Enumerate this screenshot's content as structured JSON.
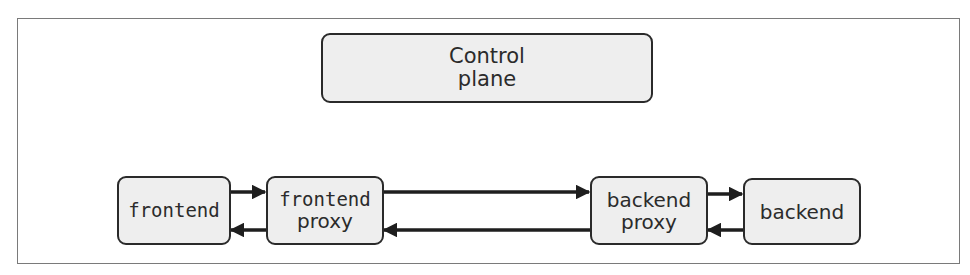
{
  "diagram": {
    "type": "service-mesh",
    "nodes": {
      "control_plane": {
        "line1": "Control",
        "line2": "plane"
      },
      "frontend": {
        "label": "frontend"
      },
      "frontend_proxy": {
        "line1": "frontend",
        "line2": "proxy"
      },
      "backend_proxy": {
        "line1": "backend",
        "line2": "proxy"
      },
      "backend": {
        "label": "backend"
      }
    },
    "edges": [
      {
        "from": "frontend",
        "to": "frontend_proxy"
      },
      {
        "from": "frontend_proxy",
        "to": "frontend"
      },
      {
        "from": "frontend_proxy",
        "to": "backend_proxy"
      },
      {
        "from": "backend_proxy",
        "to": "frontend_proxy"
      },
      {
        "from": "backend_proxy",
        "to": "backend"
      },
      {
        "from": "backend",
        "to": "backend_proxy"
      }
    ],
    "colors": {
      "node_fill": "#eeeeee",
      "stroke": "#2a2a2a",
      "frame": "#7a7a7a"
    }
  }
}
